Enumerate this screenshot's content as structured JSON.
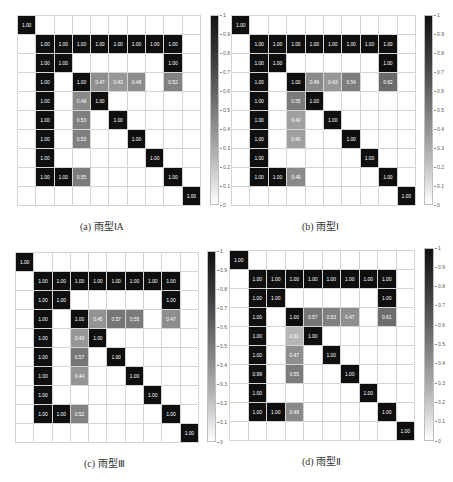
{
  "chart_data": [
    {
      "type": "heatmap",
      "title": "",
      "caption": "(a) 雨型ⅠA",
      "size": 10,
      "colorbar": {
        "min": 0,
        "max": 1,
        "ticks": [
          "0",
          "0.1",
          "0.2",
          "0.3",
          "0.4",
          "0.5",
          "0.6",
          "0.7",
          "0.8",
          "0.9",
          "1"
        ]
      },
      "cells": [
        [
          0,
          0,
          1.0
        ],
        [
          1,
          1,
          1.0
        ],
        [
          1,
          2,
          1.0
        ],
        [
          1,
          3,
          1.0
        ],
        [
          1,
          4,
          1.0
        ],
        [
          1,
          5,
          1.0
        ],
        [
          1,
          6,
          1.0
        ],
        [
          1,
          7,
          1.0
        ],
        [
          1,
          8,
          1.0
        ],
        [
          2,
          1,
          1.0
        ],
        [
          2,
          2,
          1.0
        ],
        [
          2,
          8,
          1.0
        ],
        [
          3,
          1,
          1.0
        ],
        [
          3,
          3,
          1.0
        ],
        [
          3,
          4,
          0.47
        ],
        [
          3,
          5,
          0.43
        ],
        [
          3,
          6,
          0.48
        ],
        [
          3,
          8,
          0.52
        ],
        [
          4,
          1,
          1.0
        ],
        [
          4,
          3,
          0.49
        ],
        [
          4,
          4,
          1.0
        ],
        [
          5,
          1,
          1.0
        ],
        [
          5,
          3,
          0.53
        ],
        [
          5,
          5,
          1.0
        ],
        [
          6,
          1,
          1.0
        ],
        [
          6,
          3,
          0.53
        ],
        [
          6,
          6,
          1.0
        ],
        [
          7,
          1,
          1.0
        ],
        [
          7,
          7,
          1.0
        ],
        [
          8,
          1,
          1.0
        ],
        [
          8,
          2,
          1.0
        ],
        [
          8,
          3,
          0.55
        ],
        [
          8,
          8,
          1.0
        ],
        [
          9,
          9,
          1.0
        ]
      ]
    },
    {
      "type": "heatmap",
      "title": "",
      "caption": "(b) 雨型Ⅰ",
      "size": 10,
      "colorbar": {
        "min": 0,
        "max": 1,
        "ticks": [
          "0",
          "0.1",
          "0.2",
          "0.3",
          "0.4",
          "0.5",
          "0.6",
          "0.7",
          "0.8",
          "0.9",
          "1"
        ]
      },
      "cells": [
        [
          0,
          0,
          1.0
        ],
        [
          1,
          1,
          1.0
        ],
        [
          1,
          2,
          1.0
        ],
        [
          1,
          3,
          1.0
        ],
        [
          1,
          4,
          1.0
        ],
        [
          1,
          5,
          1.0
        ],
        [
          1,
          6,
          1.0
        ],
        [
          1,
          7,
          1.0
        ],
        [
          1,
          8,
          1.0
        ],
        [
          2,
          1,
          1.0
        ],
        [
          2,
          2,
          1.0
        ],
        [
          2,
          8,
          1.0
        ],
        [
          3,
          1,
          1.0
        ],
        [
          3,
          3,
          1.0
        ],
        [
          3,
          4,
          0.49
        ],
        [
          3,
          5,
          0.43
        ],
        [
          3,
          6,
          0.54
        ],
        [
          3,
          8,
          0.62
        ],
        [
          4,
          1,
          1.0
        ],
        [
          4,
          3,
          0.55
        ],
        [
          4,
          4,
          1.0
        ],
        [
          5,
          1,
          1.0
        ],
        [
          5,
          3,
          0.4
        ],
        [
          5,
          5,
          1.0
        ],
        [
          6,
          1,
          1.0
        ],
        [
          6,
          3,
          0.4
        ],
        [
          6,
          6,
          1.0
        ],
        [
          7,
          1,
          1.0
        ],
        [
          7,
          7,
          1.0
        ],
        [
          8,
          1,
          1.0
        ],
        [
          8,
          2,
          1.0
        ],
        [
          8,
          3,
          0.49
        ],
        [
          8,
          8,
          1.0
        ],
        [
          9,
          9,
          1.0
        ]
      ]
    },
    {
      "type": "heatmap",
      "title": "",
      "caption": "(c) 雨型Ⅲ",
      "size": 10,
      "colorbar": {
        "min": 0,
        "max": 1,
        "ticks": [
          "0",
          "0.1",
          "0.2",
          "0.3",
          "0.4",
          "0.5",
          "0.6",
          "0.7",
          "0.8",
          "0.9",
          "1"
        ]
      },
      "cells": [
        [
          0,
          0,
          1.0
        ],
        [
          1,
          1,
          1.0
        ],
        [
          1,
          2,
          1.0
        ],
        [
          1,
          3,
          1.0
        ],
        [
          1,
          4,
          1.0
        ],
        [
          1,
          5,
          1.0
        ],
        [
          1,
          6,
          1.0
        ],
        [
          1,
          7,
          1.0
        ],
        [
          1,
          8,
          1.0
        ],
        [
          2,
          1,
          1.0
        ],
        [
          2,
          2,
          1.0
        ],
        [
          2,
          8,
          1.0
        ],
        [
          3,
          1,
          1.0
        ],
        [
          3,
          3,
          1.0
        ],
        [
          3,
          4,
          0.45
        ],
        [
          3,
          5,
          0.57
        ],
        [
          3,
          6,
          0.55
        ],
        [
          3,
          8,
          0.47
        ],
        [
          4,
          1,
          1.0
        ],
        [
          4,
          3,
          0.43
        ],
        [
          4,
          4,
          1.0
        ],
        [
          5,
          1,
          1.0
        ],
        [
          5,
          3,
          0.57
        ],
        [
          5,
          5,
          1.0
        ],
        [
          6,
          1,
          1.0
        ],
        [
          6,
          3,
          0.44
        ],
        [
          6,
          6,
          1.0
        ],
        [
          7,
          1,
          1.0
        ],
        [
          7,
          7,
          1.0
        ],
        [
          8,
          1,
          1.0
        ],
        [
          8,
          2,
          1.0
        ],
        [
          8,
          3,
          0.52
        ],
        [
          8,
          8,
          1.0
        ],
        [
          9,
          9,
          1.0
        ]
      ]
    },
    {
      "type": "heatmap",
      "title": "",
      "caption": "(d) 雨型Ⅱ",
      "size": 10,
      "colorbar": {
        "min": 0,
        "max": 1,
        "ticks": [
          "0",
          "0.1",
          "0.2",
          "0.3",
          "0.4",
          "0.5",
          "0.6",
          "0.7",
          "0.8",
          "0.9",
          "1"
        ]
      },
      "cells": [
        [
          0,
          0,
          1.0
        ],
        [
          1,
          1,
          1.0
        ],
        [
          1,
          2,
          1.0
        ],
        [
          1,
          3,
          1.0
        ],
        [
          1,
          4,
          1.0
        ],
        [
          1,
          5,
          1.0
        ],
        [
          1,
          6,
          1.0
        ],
        [
          1,
          7,
          1.0
        ],
        [
          1,
          8,
          1.0
        ],
        [
          2,
          1,
          1.0
        ],
        [
          2,
          2,
          1.0
        ],
        [
          2,
          8,
          1.0
        ],
        [
          3,
          1,
          1.0
        ],
        [
          3,
          3,
          1.0
        ],
        [
          3,
          4,
          0.57
        ],
        [
          3,
          5,
          0.53
        ],
        [
          3,
          6,
          0.47
        ],
        [
          3,
          8,
          0.61
        ],
        [
          4,
          1,
          1.0
        ],
        [
          4,
          3,
          0.31
        ],
        [
          4,
          4,
          1.0
        ],
        [
          5,
          1,
          1.0
        ],
        [
          5,
          3,
          0.47
        ],
        [
          5,
          5,
          1.0
        ],
        [
          6,
          1,
          0.99
        ],
        [
          6,
          3,
          0.55
        ],
        [
          6,
          6,
          1.0
        ],
        [
          7,
          1,
          1.0
        ],
        [
          7,
          7,
          1.0
        ],
        [
          8,
          1,
          1.0
        ],
        [
          8,
          2,
          1.0
        ],
        [
          8,
          3,
          0.49
        ],
        [
          8,
          8,
          1.0
        ],
        [
          9,
          9,
          1.0
        ]
      ]
    }
  ],
  "layout": {
    "panels": [
      {
        "grid": {
          "x": 17,
          "y": 15,
          "w": 183,
          "h": 190
        },
        "cbar": {
          "x": 210,
          "y": 15,
          "w": 9,
          "h": 190
        },
        "caption": {
          "x": 80,
          "y": 218
        }
      },
      {
        "grid": {
          "x": 231,
          "y": 15,
          "w": 184,
          "h": 190
        },
        "cbar": {
          "x": 424,
          "y": 15,
          "w": 9,
          "h": 190
        },
        "caption": {
          "x": 302,
          "y": 218
        }
      },
      {
        "grid": {
          "x": 15,
          "y": 252,
          "w": 183,
          "h": 190
        },
        "cbar": {
          "x": 207,
          "y": 251,
          "w": 9,
          "h": 191
        },
        "caption": {
          "x": 84,
          "y": 455
        }
      },
      {
        "grid": {
          "x": 229,
          "y": 250,
          "w": 185,
          "h": 190
        },
        "cbar": {
          "x": 424,
          "y": 248,
          "w": 10,
          "h": 193
        },
        "caption": {
          "x": 302,
          "y": 453
        }
      }
    ]
  }
}
